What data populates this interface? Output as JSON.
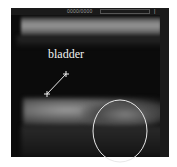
{
  "image": {
    "type": "ultrasound",
    "header_text": "0000/0000",
    "annotation_label": "bladder",
    "marker": {
      "symbol": "+",
      "line_from": [
        45,
        95
      ],
      "line_to": [
        66,
        75
      ]
    },
    "ellipse": {
      "cx": 120,
      "cy": 131,
      "rx": 27,
      "ry": 31,
      "color": "#e8e8e8"
    }
  }
}
